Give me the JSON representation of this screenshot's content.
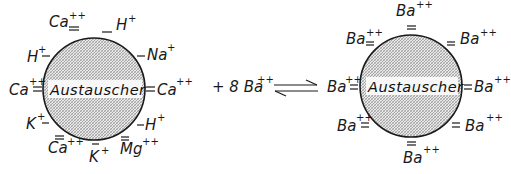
{
  "diagram": {
    "left_exchanger": {
      "center_label": "Austauscher",
      "ions": [
        {
          "ion": "Ca",
          "charge": "++",
          "bond": "="
        },
        {
          "ion": "H",
          "charge": "+",
          "bond": "—"
        },
        {
          "ion": "Na",
          "charge": "+",
          "bond": "—"
        },
        {
          "ion": "Ca",
          "charge": "++",
          "bond": "="
        },
        {
          "ion": "H",
          "charge": "+",
          "bond": "—"
        },
        {
          "ion": "Mg",
          "charge": "++",
          "bond": "="
        },
        {
          "ion": "K",
          "charge": "+",
          "bond": "—"
        },
        {
          "ion": "Ca",
          "charge": "++",
          "bond": "="
        },
        {
          "ion": "K",
          "charge": "+",
          "bond": "—"
        },
        {
          "ion": "Ca",
          "charge": "++",
          "bond": "="
        },
        {
          "ion": "H",
          "charge": "+",
          "bond": "—"
        }
      ]
    },
    "reagent": {
      "text": "+ 8 Ba",
      "charge": "++"
    },
    "equilibrium_arrow": "⇌",
    "right_exchanger": {
      "center_label": "Austauscher",
      "ions": [
        {
          "ion": "Ba",
          "charge": "++",
          "bond": "="
        },
        {
          "ion": "Ba",
          "charge": "++",
          "bond": "="
        },
        {
          "ion": "Ba",
          "charge": "++",
          "bond": "="
        },
        {
          "ion": "Ba",
          "charge": "++",
          "bond": "="
        },
        {
          "ion": "Ba",
          "charge": "++",
          "bond": "="
        },
        {
          "ion": "Ba",
          "charge": "++",
          "bond": "="
        },
        {
          "ion": "Ba",
          "charge": "++",
          "bond": "="
        },
        {
          "ion": "Ba",
          "charge": "++",
          "bond": "="
        }
      ]
    }
  }
}
